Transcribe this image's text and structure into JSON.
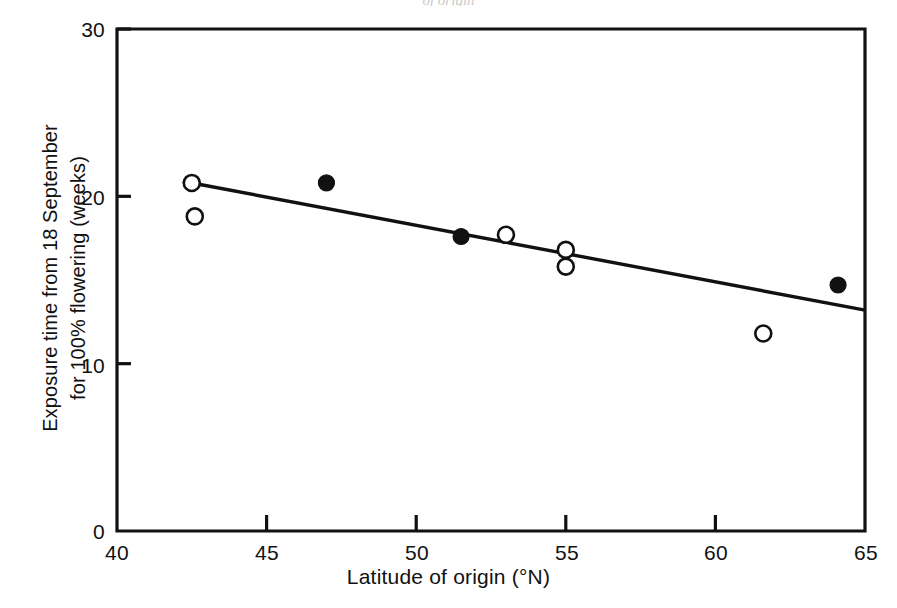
{
  "figure": {
    "background_color": "#ffffff",
    "ink_color": "#111111",
    "top_edge_artifact": "of origin"
  },
  "axes": {
    "x": {
      "title": "Latitude of origin (°N)",
      "ticks": [
        40,
        45,
        50,
        55,
        60,
        65
      ],
      "tick_labels": [
        "40",
        "45",
        "50",
        "55",
        "60",
        "65"
      ],
      "range": [
        40,
        65
      ]
    },
    "y": {
      "title_line1": "Exposure time from 18 September",
      "title_line2": "for 100% flowering (weeks)",
      "ticks": [
        0,
        10,
        20,
        30
      ],
      "tick_labels": [
        "0",
        "10",
        "20",
        "30"
      ],
      "range": [
        0,
        30
      ]
    }
  },
  "chart_data": {
    "type": "scatter",
    "title": "",
    "xlabel": "Latitude of origin (°N)",
    "ylabel": "Exposure time from 18 September for 100% flowering (weeks)",
    "xlim": [
      40,
      65
    ],
    "ylim": [
      0,
      30
    ],
    "xticks": [
      40,
      45,
      50,
      55,
      60,
      65
    ],
    "yticks": [
      0,
      10,
      20,
      30
    ],
    "grid": false,
    "legend": "none",
    "series": [
      {
        "name": "open-circle",
        "marker": "open circle",
        "marker_fill": "#ffffff",
        "marker_stroke": "#111111",
        "points": [
          {
            "x": 42.5,
            "y": 20.8
          },
          {
            "x": 42.6,
            "y": 18.8
          },
          {
            "x": 53.0,
            "y": 17.7
          },
          {
            "x": 55.0,
            "y": 16.8
          },
          {
            "x": 55.0,
            "y": 15.8
          },
          {
            "x": 61.6,
            "y": 11.8
          }
        ]
      },
      {
        "name": "filled-circle",
        "marker": "filled circle",
        "marker_fill": "#111111",
        "marker_stroke": "#111111",
        "points": [
          {
            "x": 47.0,
            "y": 20.8
          },
          {
            "x": 51.5,
            "y": 17.6
          },
          {
            "x": 64.1,
            "y": 14.7
          }
        ]
      }
    ],
    "trendline": {
      "name": "regression-line",
      "x_start": 42.2,
      "y_start": 20.9,
      "x_end": 65.0,
      "y_end": 13.2
    }
  }
}
